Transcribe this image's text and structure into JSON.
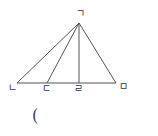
{
  "diagram": {
    "type": "triangle",
    "stroke_color": "#555555",
    "points": {
      "apex": {
        "label": "ㄱ",
        "x": 79,
        "y": 23
      },
      "left": {
        "label": "ㄴ",
        "x": 17,
        "y": 83
      },
      "p1": {
        "label": "ㄷ",
        "x": 47,
        "y": 83
      },
      "foot": {
        "label": "ㄹ",
        "x": 79,
        "y": 83
      },
      "right": {
        "label": "ㅁ",
        "x": 116,
        "y": 83
      }
    },
    "segments": [
      [
        "ㄱ",
        "ㄴ"
      ],
      [
        "ㄱ",
        "ㄷ"
      ],
      [
        "ㄱ",
        "ㄹ"
      ],
      [
        "ㄱ",
        "ㅁ"
      ],
      [
        "ㄴ",
        "ㅁ"
      ]
    ]
  },
  "labels": {
    "apex": "ㄱ",
    "left": "ㄴ",
    "p1": "ㄷ",
    "foot": "ㄹ",
    "right": "ㅁ"
  },
  "answer_blank": "("
}
